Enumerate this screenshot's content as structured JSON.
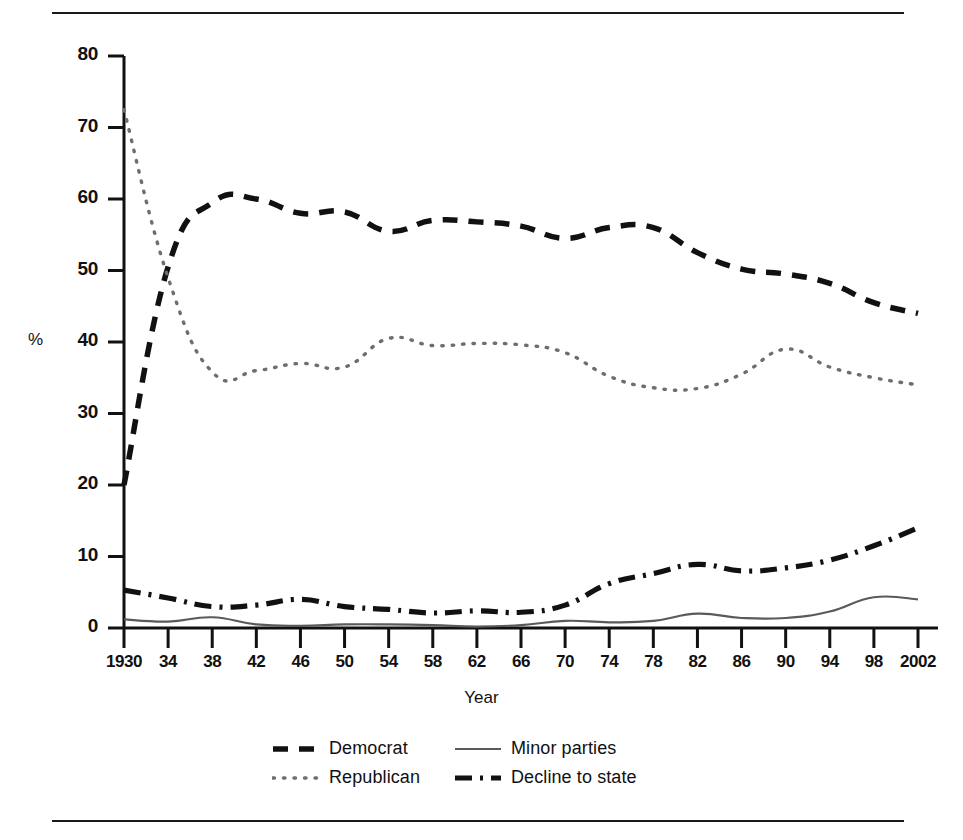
{
  "axes": {
    "ylabel": "%",
    "xlabel": "Year",
    "yticks": [
      "0",
      "10",
      "20",
      "30",
      "40",
      "50",
      "60",
      "70",
      "80"
    ],
    "xticks": [
      "1930",
      "34",
      "38",
      "42",
      "46",
      "50",
      "54",
      "58",
      "62",
      "66",
      "70",
      "74",
      "78",
      "82",
      "86",
      "90",
      "94",
      "98",
      "2002"
    ]
  },
  "legend": {
    "items": [
      {
        "label": "Democrat",
        "style": "dashed",
        "color": "#111111"
      },
      {
        "label": "Minor parties",
        "style": "solid",
        "color": "#555555"
      },
      {
        "label": "Republican",
        "style": "dotted",
        "color": "#777777"
      },
      {
        "label": "Decline to state",
        "style": "dashdot",
        "color": "#111111"
      }
    ]
  },
  "chart_data": {
    "type": "line",
    "title": "",
    "xlabel": "Year",
    "ylabel": "%",
    "xlim": [
      1930,
      2002
    ],
    "ylim": [
      0,
      80
    ],
    "grid": false,
    "legend_position": "bottom",
    "x": [
      1930,
      1934,
      1938,
      1942,
      1946,
      1950,
      1954,
      1958,
      1962,
      1966,
      1970,
      1974,
      1978,
      1982,
      1986,
      1990,
      1994,
      1998,
      2002
    ],
    "series": [
      {
        "name": "Democrat",
        "style": "dashed",
        "values": [
          20.0,
          50.5,
          59.5,
          60.0,
          58.0,
          58.2,
          55.5,
          57.0,
          56.8,
          56.2,
          54.5,
          56.0,
          56.0,
          52.5,
          50.2,
          49.5,
          48.2,
          45.5,
          44.0
        ]
      },
      {
        "name": "Republican",
        "style": "dotted",
        "values": [
          72.5,
          49.0,
          35.8,
          36.0,
          37.0,
          36.5,
          40.5,
          39.5,
          39.8,
          39.6,
          38.5,
          35.2,
          33.6,
          33.5,
          35.5,
          39.0,
          36.5,
          35.0,
          34.0
        ]
      },
      {
        "name": "Minor parties",
        "style": "solid",
        "values": [
          1.2,
          0.9,
          1.5,
          0.5,
          0.3,
          0.5,
          0.5,
          0.4,
          0.2,
          0.4,
          1.0,
          0.8,
          1.0,
          2.0,
          1.4,
          1.4,
          2.3,
          4.3,
          4.0
        ]
      },
      {
        "name": "Decline to state",
        "style": "dashdot",
        "values": [
          5.3,
          4.2,
          3.0,
          3.2,
          4.0,
          3.0,
          2.6,
          2.1,
          2.4,
          2.2,
          3.2,
          6.2,
          7.6,
          8.9,
          8.0,
          8.4,
          9.5,
          11.5,
          14.0
        ]
      }
    ]
  }
}
